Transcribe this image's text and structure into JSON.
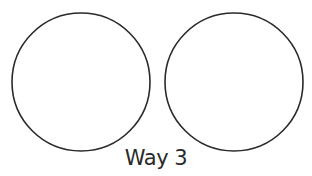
{
  "diagram": {
    "circles": [
      {
        "id": "left-circle",
        "cx": 81,
        "cy": 82,
        "r": 69
      },
      {
        "id": "right-circle",
        "cx": 234,
        "cy": 82,
        "r": 69
      }
    ],
    "stroke_color": "#2a2a2a",
    "caption": "Way 3"
  }
}
